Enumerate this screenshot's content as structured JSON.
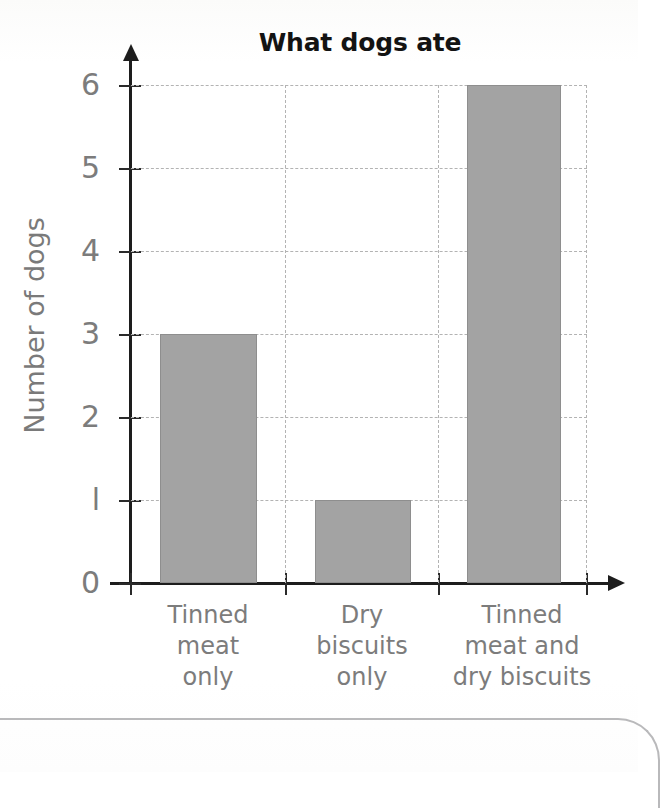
{
  "chart_data": {
    "type": "bar",
    "title": "What dogs ate",
    "xlabel": "",
    "ylabel": "Number of dogs",
    "categories": [
      "Tinned meat only",
      "Dry biscuits only",
      "Tinned meat and dry biscuits"
    ],
    "category_lines": [
      [
        "Tinned",
        "meat",
        "only"
      ],
      [
        "Dry",
        "biscuits",
        "only"
      ],
      [
        "Tinned",
        "meat and",
        "dry biscuits"
      ]
    ],
    "values": [
      3,
      1,
      6
    ],
    "ylim": [
      0,
      6
    ],
    "yticks": [
      0,
      1,
      2,
      3,
      4,
      5,
      6
    ],
    "ytick_labels": [
      "0",
      "l",
      "2",
      "3",
      "4",
      "5",
      "6"
    ],
    "grid": true,
    "legend": "none",
    "bar_color": "#a3a3a3",
    "bar_edge_color": "#8e8e8e",
    "axis_color": "#1d1d1d",
    "grid_color": "#b3b3b3",
    "label_color": "#7c7c7c",
    "title_color": "#131313"
  }
}
